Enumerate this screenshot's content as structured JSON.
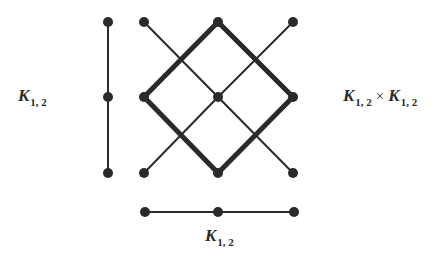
{
  "labels": {
    "left": {
      "symbol": "K",
      "subscript": "1, 2"
    },
    "right": {
      "left_symbol": "K",
      "left_subscript": "1, 2",
      "operator": "×",
      "right_symbol": "K",
      "right_subscript": "1, 2"
    },
    "bottom": {
      "symbol": "K",
      "subscript": "1, 2"
    }
  },
  "colors": {
    "stroke": "#2a2a2a",
    "vertex": "#2a2a2a",
    "background": "#ffffff"
  },
  "graphs": {
    "vertical_path": {
      "name": "K1,2 (vertical)",
      "vertices": [
        [
          108,
          22
        ],
        [
          108,
          97
        ],
        [
          108,
          173
        ]
      ],
      "edges": [
        [
          0,
          1
        ],
        [
          1,
          2
        ]
      ]
    },
    "horizontal_path": {
      "name": "K1,2 (horizontal)",
      "vertices": [
        [
          145,
          212
        ],
        [
          218,
          212
        ],
        [
          294,
          212
        ]
      ],
      "edges": [
        [
          0,
          1
        ],
        [
          1,
          2
        ]
      ]
    },
    "product": {
      "name": "K1,2 × K1,2",
      "vertices": [
        [
          144,
          22
        ],
        [
          218,
          22
        ],
        [
          293,
          22
        ],
        [
          144,
          97
        ],
        [
          218,
          97
        ],
        [
          293,
          97
        ],
        [
          144,
          173
        ],
        [
          218,
          173
        ],
        [
          293,
          173
        ]
      ],
      "thin_edges": [
        [
          0,
          4
        ],
        [
          4,
          8
        ],
        [
          2,
          4
        ],
        [
          4,
          6
        ]
      ],
      "thick_edges": [
        [
          1,
          3
        ],
        [
          3,
          7
        ],
        [
          7,
          5
        ],
        [
          5,
          1
        ]
      ]
    }
  }
}
